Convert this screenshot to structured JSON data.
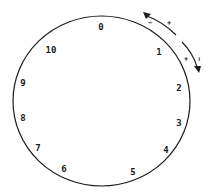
{
  "diagram": {
    "type": "circular-dial",
    "positions": [
      {
        "label": "0",
        "x": 101,
        "y": 30
      },
      {
        "label": "1",
        "x": 159,
        "y": 55
      },
      {
        "label": "2",
        "x": 179,
        "y": 91
      },
      {
        "label": "3",
        "x": 179,
        "y": 126
      },
      {
        "label": "4",
        "x": 166,
        "y": 153
      },
      {
        "label": "5",
        "x": 133,
        "y": 175
      },
      {
        "label": "6",
        "x": 64,
        "y": 172
      },
      {
        "label": "7",
        "x": 38,
        "y": 151
      },
      {
        "label": "8",
        "x": 23,
        "y": 121
      },
      {
        "label": "9",
        "x": 23,
        "y": 86
      },
      {
        "label": "10",
        "x": 48,
        "y": 53
      }
    ],
    "arrows": [
      {
        "name": "counterclockwise-arrow",
        "signs": [
          "−",
          "+"
        ]
      },
      {
        "name": "clockwise-arrow",
        "signs": [
          "+",
          "−"
        ]
      }
    ]
  },
  "colors": {
    "stroke": "#1a1a1a",
    "background": "#ffffff"
  }
}
